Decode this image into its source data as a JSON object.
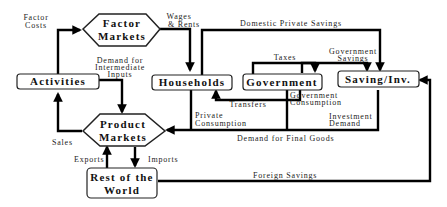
{
  "diagram": {
    "nodes": {
      "factor_markets": {
        "line1": "Factor",
        "line2": "Markets"
      },
      "activities": {
        "label": "Activities"
      },
      "households": {
        "label": "Households"
      },
      "government": {
        "label": "Government"
      },
      "saving_inv": {
        "label": "Saving/Inv."
      },
      "product_markets": {
        "line1": "Product",
        "line2": "Markets"
      },
      "rest_of_world": {
        "line1": "Rest of the",
        "line2": "World"
      }
    },
    "flows": {
      "factor_costs": {
        "line1": "Factor",
        "line2": "Costs"
      },
      "wages_rents": {
        "line1": "Wages",
        "line2": "& Rents"
      },
      "domestic_private_savings": "Domestic Private Savings",
      "demand_intermediate": {
        "line1": "Demand for",
        "line2": "Intermediate",
        "line3": "Inputs"
      },
      "taxes": "Taxes",
      "government_savings": {
        "line1": "Government",
        "line2": "Savings"
      },
      "transfers": "Transfers",
      "government_consumption": {
        "line1": "Government",
        "line2": "Consumption"
      },
      "private_consumption": {
        "line1": "Private",
        "line2": "Consumption"
      },
      "investment_demand": {
        "line1": "Investment",
        "line2": "Demand"
      },
      "demand_final_goods": "Demand for Final Goods",
      "sales": "Sales",
      "exports": "Exports",
      "imports": "Imports",
      "foreign_savings": "Foreign Savings"
    }
  }
}
